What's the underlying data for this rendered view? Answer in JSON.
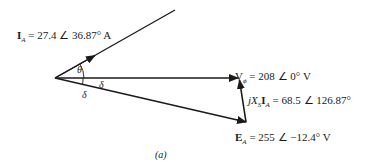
{
  "diagram": {
    "caption": "(a)",
    "phasors": {
      "armature_current": {
        "symbol": "I",
        "subscript": "A",
        "rest": " = 27.4 ∠ 36.87° A"
      },
      "phase_voltage": {
        "symbol": "V",
        "subscript": "ϕ",
        "rest": " = 208 ∠ 0° V"
      },
      "reactance_drop": {
        "prefix": "jX",
        "subscript_s": "S",
        "symbol": "I",
        "subscript": "A",
        "rest": " = 68.5 ∠ 126.87°"
      },
      "internal_voltage": {
        "symbol": "E",
        "subscript": "A",
        "rest": " = 255 ∠ −12.4° V"
      }
    },
    "angles": {
      "theta": "θ",
      "delta_upper": "δ",
      "delta_lower": "δ"
    }
  }
}
